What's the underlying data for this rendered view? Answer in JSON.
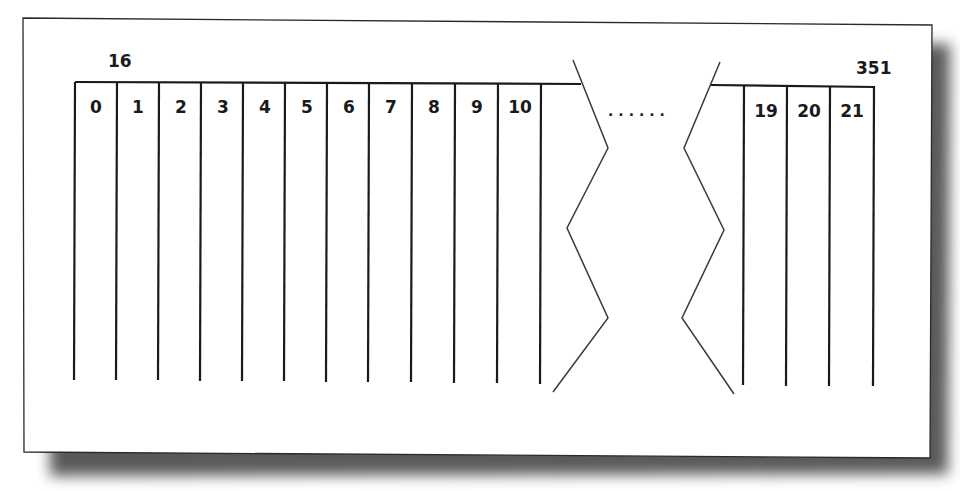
{
  "diagram": {
    "left_label": "16",
    "right_label": "351",
    "ellipsis": "......",
    "left_slots": [
      "0",
      "1",
      "2",
      "3",
      "4",
      "5",
      "6",
      "7",
      "8",
      "9",
      "10"
    ],
    "right_slots": [
      "19",
      "20",
      "21"
    ],
    "colors": {
      "line": "#1a1a1a",
      "break_line": "#3a3a3a",
      "card_bg": "#ffffff",
      "shadow": "#3c3c3c"
    }
  }
}
